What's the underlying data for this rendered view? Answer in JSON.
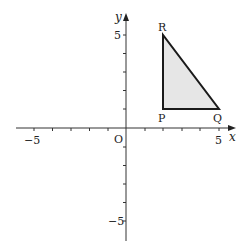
{
  "diagram": {
    "type": "coordinate-grid",
    "x_axis_label": "x",
    "y_axis_label": "y",
    "origin_label": "O",
    "x_tick_labels": [
      "−5",
      "5"
    ],
    "y_tick_labels": [
      "5",
      "−5"
    ],
    "range": {
      "x": [
        -6,
        6
      ],
      "y": [
        -6,
        6
      ]
    },
    "shape": {
      "type": "triangle",
      "fill": "#e6e6e6",
      "stroke": "#1a1a1a",
      "vertices": [
        {
          "label": "P",
          "x": 2,
          "y": 1
        },
        {
          "label": "Q",
          "x": 5,
          "y": 1
        },
        {
          "label": "R",
          "x": 2,
          "y": 5
        }
      ]
    }
  }
}
